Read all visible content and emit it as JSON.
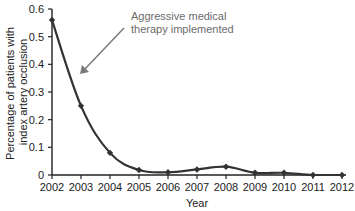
{
  "chart_data": {
    "type": "line",
    "title": "",
    "xlabel": "Year",
    "ylabel_lines": [
      "Percentage of patients with",
      "index artery occlusion"
    ],
    "ylabel": "Percentage of patients with index artery occlusion",
    "x": [
      2002,
      2003,
      2004,
      2005,
      2006,
      2007,
      2008,
      2009,
      2010,
      2011,
      2012
    ],
    "series": [
      {
        "name": "Index artery occlusion",
        "values": [
          0.56,
          0.25,
          0.08,
          0.018,
          0.01,
          0.02,
          0.03,
          0.008,
          0.008,
          0.0,
          0.0
        ]
      }
    ],
    "xticks": [
      "2002",
      "2003",
      "2004",
      "2005",
      "2006",
      "2007",
      "2008",
      "2009",
      "2010",
      "2011",
      "2012"
    ],
    "yticks": [
      "0",
      "0.1",
      "0.2",
      "0.3",
      "0.4",
      "0.5",
      "0.6"
    ],
    "ylim": [
      0,
      0.6
    ],
    "grid": false,
    "legend": null,
    "annotations": [
      {
        "text_lines": [
          "Aggressive medical",
          "therapy implemented"
        ],
        "arrow_points_to": {
          "x": 2003,
          "y": 0.36
        }
      }
    ],
    "colors": {
      "line": "#333333",
      "annotation": "#7a7a7a",
      "axis": "#222222"
    }
  }
}
